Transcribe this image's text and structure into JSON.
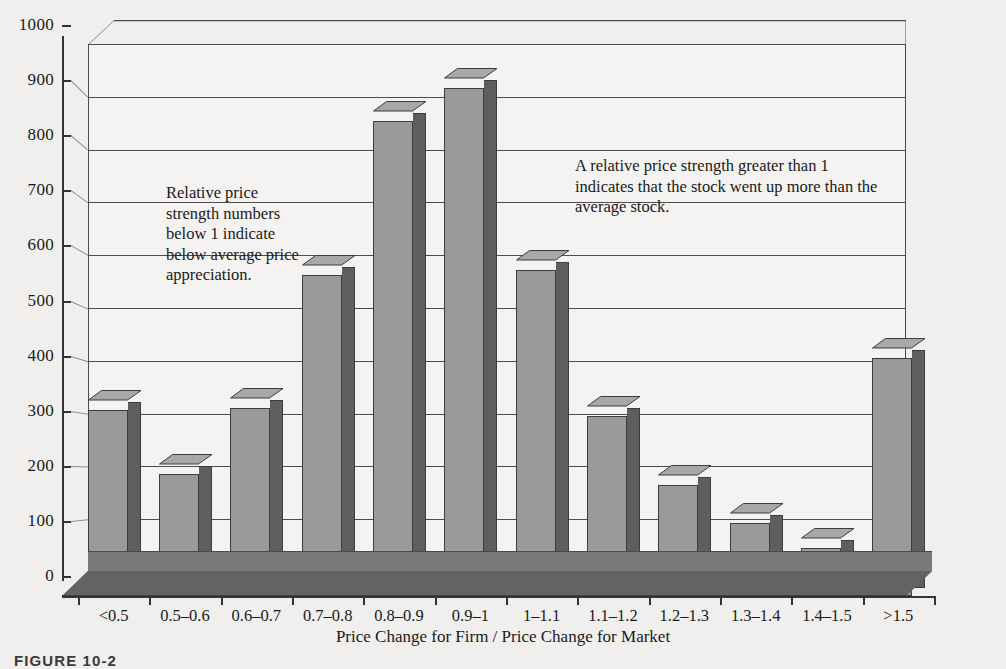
{
  "chart_data": {
    "type": "bar",
    "title": "",
    "xlabel": "Price Change for Firm / Price Change for Market",
    "ylabel": "",
    "ylim": [
      0,
      1000
    ],
    "ytick_step": 100,
    "grid": true,
    "legend": "none",
    "style": "3d-column",
    "categories": [
      "<0.5",
      "0.5–0.6",
      "0.6–0.7",
      "0.7–0.8",
      "0.8–0.9",
      "0.9–1",
      "1–1.1",
      "1.1–1.2",
      "1.2–1.3",
      "1.3–1.4",
      "1.4–1.5",
      ">1.5"
    ],
    "values": [
      355,
      240,
      360,
      600,
      880,
      940,
      610,
      345,
      220,
      150,
      105,
      450
    ],
    "ytick_labels": [
      "1000",
      "900",
      "800",
      "700",
      "600",
      "500",
      "400",
      "300",
      "200",
      "100",
      "0"
    ],
    "annotations": [
      {
        "name": "left-note",
        "text": "Relative price\nstrength numbers\nbelow 1 indicate\nbelow average price\nappreciation."
      },
      {
        "name": "right-note",
        "text": "A relative price strength greater than 1\nindicates that the stock went up more than the\naverage stock."
      }
    ]
  },
  "figure": {
    "caption": "FIGURE 10-2",
    "background_color": "#f0efed",
    "plot_background_color": "#f4f3f1",
    "bar_front_color": "#9a9a9a",
    "bar_side_color": "#5e5e5e",
    "bar_top_color": "#a8a8a8",
    "axis_color": "#333333",
    "grid_color": "#4d4d4d"
  }
}
